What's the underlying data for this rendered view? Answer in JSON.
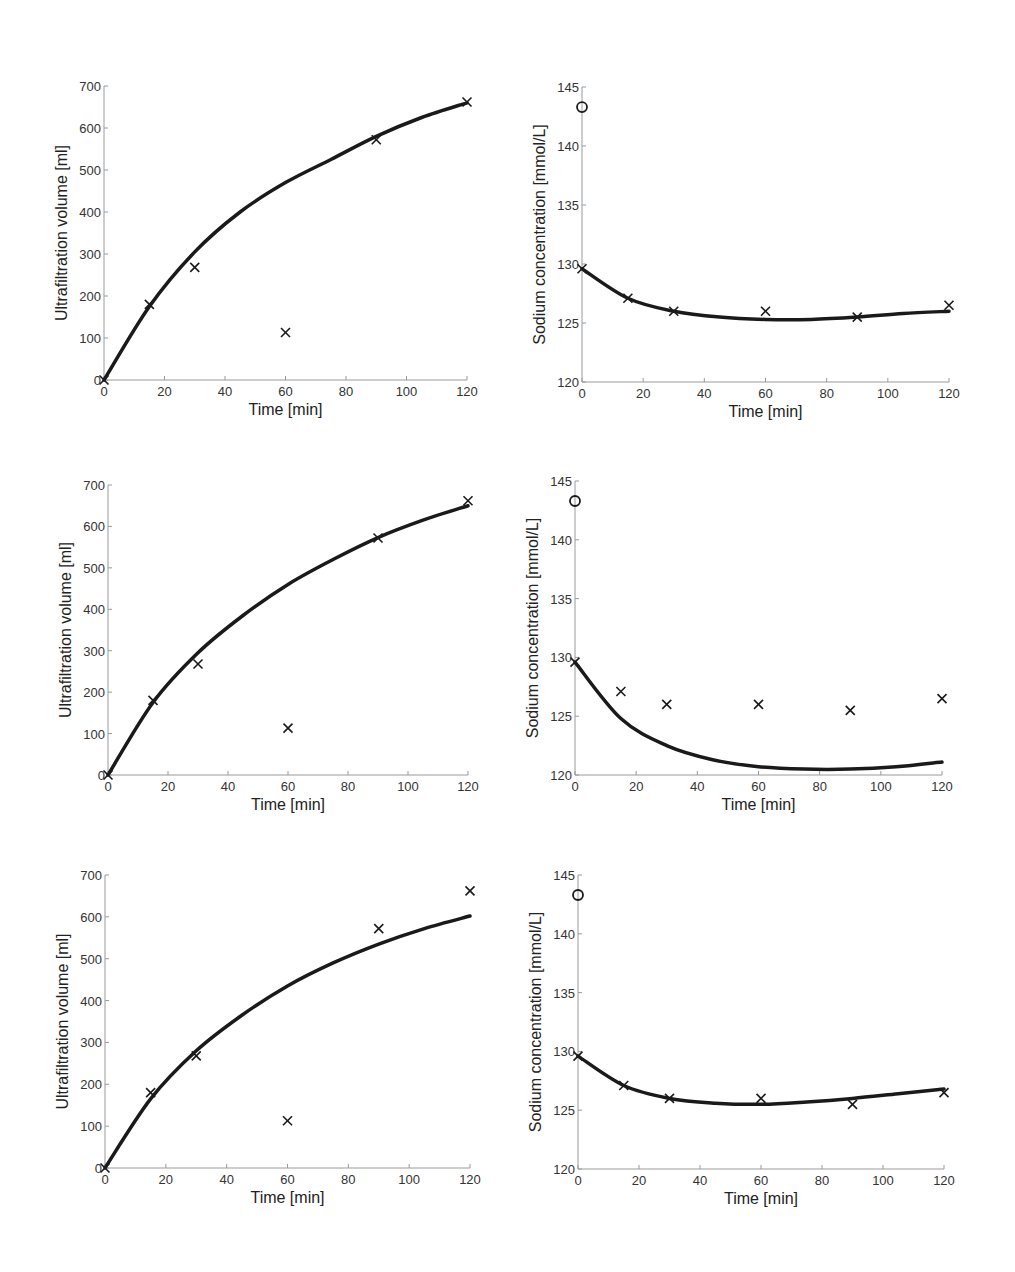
{
  "figure": {
    "background": "#ffffff",
    "line_color": "#1a1a1a",
    "axis_color": "#9a9a9a"
  },
  "chart_data": [
    {
      "id": "uf-1",
      "type": "line",
      "title": "",
      "xlabel": "Time [min]",
      "ylabel": "Ultrafiltration volume [ml]",
      "xlim": [
        0,
        120
      ],
      "ylim": [
        0,
        700
      ],
      "xticks": [
        0,
        20,
        40,
        60,
        80,
        100,
        120
      ],
      "yticks": [
        0,
        100,
        200,
        300,
        400,
        500,
        600,
        700
      ],
      "grid": false,
      "box": {
        "x0": 104,
        "x1": 467,
        "y0": 380,
        "y1": 86
      },
      "series": [
        {
          "name": "model",
          "style": "line",
          "x": [
            0,
            15,
            30,
            45,
            60,
            75,
            90,
            105,
            120
          ],
          "y": [
            0,
            175,
            305,
            400,
            470,
            525,
            580,
            625,
            660
          ]
        },
        {
          "name": "measured",
          "style": "x",
          "x": [
            0,
            15,
            30,
            60,
            90,
            120
          ],
          "y": [
            0,
            180,
            268,
            113,
            572,
            662
          ]
        }
      ]
    },
    {
      "id": "na-1",
      "type": "line",
      "title": "",
      "xlabel": "Time [min]",
      "ylabel": "Sodium concentration [mmol/L]",
      "xlim": [
        0,
        120
      ],
      "ylim": [
        120,
        145
      ],
      "xticks": [
        0,
        20,
        40,
        60,
        80,
        100,
        120
      ],
      "yticks": [
        120,
        125,
        130,
        135,
        140,
        145
      ],
      "grid": false,
      "box": {
        "x0": 582,
        "x1": 949,
        "y0": 382,
        "y1": 87
      },
      "series": [
        {
          "name": "model",
          "style": "line",
          "x": [
            0,
            15,
            30,
            45,
            60,
            75,
            90,
            105,
            120
          ],
          "y": [
            129.6,
            127.1,
            126.0,
            125.5,
            125.3,
            125.3,
            125.5,
            125.8,
            126.0
          ]
        },
        {
          "name": "measured",
          "style": "x",
          "x": [
            0,
            15,
            30,
            60,
            90,
            120
          ],
          "y": [
            129.6,
            127.1,
            126.0,
            126.0,
            125.5,
            126.5
          ]
        },
        {
          "name": "initial",
          "style": "o",
          "x": [
            0
          ],
          "y": [
            143.3
          ]
        }
      ]
    },
    {
      "id": "uf-2",
      "type": "line",
      "title": "",
      "xlabel": "Time [min]",
      "ylabel": "Ultrafiltration volume [ml]",
      "xlim": [
        0,
        120
      ],
      "ylim": [
        0,
        700
      ],
      "xticks": [
        0,
        20,
        40,
        60,
        80,
        100,
        120
      ],
      "yticks": [
        0,
        100,
        200,
        300,
        400,
        500,
        600,
        700
      ],
      "grid": false,
      "box": {
        "x0": 108,
        "x1": 468,
        "y0": 775,
        "y1": 485
      },
      "series": [
        {
          "name": "model",
          "style": "line",
          "x": [
            0,
            15,
            30,
            45,
            60,
            75,
            90,
            105,
            120
          ],
          "y": [
            0,
            175,
            295,
            385,
            460,
            520,
            573,
            615,
            650
          ]
        },
        {
          "name": "measured",
          "style": "x",
          "x": [
            0,
            15,
            30,
            60,
            90,
            120
          ],
          "y": [
            0,
            180,
            268,
            113,
            572,
            662
          ]
        }
      ]
    },
    {
      "id": "na-2",
      "type": "line",
      "title": "",
      "xlabel": "Time [min]",
      "ylabel": "Sodium concentration [mmol/L]",
      "xlim": [
        0,
        120
      ],
      "ylim": [
        120,
        145
      ],
      "xticks": [
        0,
        20,
        40,
        60,
        80,
        100,
        120
      ],
      "yticks": [
        120,
        125,
        130,
        135,
        140,
        145
      ],
      "grid": false,
      "box": {
        "x0": 575,
        "x1": 942,
        "y0": 775,
        "y1": 481
      },
      "series": [
        {
          "name": "model",
          "style": "line",
          "x": [
            0,
            15,
            30,
            45,
            60,
            75,
            90,
            105,
            120
          ],
          "y": [
            129.6,
            124.8,
            122.5,
            121.3,
            120.7,
            120.5,
            120.5,
            120.7,
            121.1
          ]
        },
        {
          "name": "measured",
          "style": "x",
          "x": [
            0,
            15,
            30,
            60,
            90,
            120
          ],
          "y": [
            129.6,
            127.1,
            126.0,
            126.0,
            125.5,
            126.5
          ]
        },
        {
          "name": "initial",
          "style": "o",
          "x": [
            0
          ],
          "y": [
            143.3
          ]
        }
      ]
    },
    {
      "id": "uf-3",
      "type": "line",
      "title": "",
      "xlabel": "Time [min]",
      "ylabel": "Ultrafiltration volume [ml]",
      "xlim": [
        0,
        120
      ],
      "ylim": [
        0,
        700
      ],
      "xticks": [
        0,
        20,
        40,
        60,
        80,
        100,
        120
      ],
      "yticks": [
        0,
        100,
        200,
        300,
        400,
        500,
        600,
        700
      ],
      "grid": false,
      "box": {
        "x0": 105,
        "x1": 470,
        "y0": 1168,
        "y1": 875
      },
      "series": [
        {
          "name": "model",
          "style": "line",
          "x": [
            0,
            15,
            30,
            45,
            60,
            75,
            90,
            105,
            120
          ],
          "y": [
            0,
            165,
            280,
            365,
            435,
            490,
            535,
            572,
            602
          ]
        },
        {
          "name": "measured",
          "style": "x",
          "x": [
            0,
            15,
            30,
            60,
            90,
            120
          ],
          "y": [
            0,
            180,
            268,
            113,
            572,
            662
          ]
        }
      ]
    },
    {
      "id": "na-3",
      "type": "line",
      "title": "",
      "xlabel": "Time [min]",
      "ylabel": "Sodium concentration [mmol/L]",
      "xlim": [
        0,
        120
      ],
      "ylim": [
        120,
        145
      ],
      "xticks": [
        0,
        20,
        40,
        60,
        80,
        100,
        120
      ],
      "yticks": [
        120,
        125,
        130,
        135,
        140,
        145
      ],
      "grid": false,
      "box": {
        "x0": 578,
        "x1": 944,
        "y0": 1169,
        "y1": 875
      },
      "series": [
        {
          "name": "model",
          "style": "line",
          "x": [
            0,
            15,
            30,
            45,
            60,
            75,
            90,
            105,
            120
          ],
          "y": [
            129.6,
            127.1,
            126.0,
            125.6,
            125.5,
            125.7,
            126.0,
            126.4,
            126.8
          ]
        },
        {
          "name": "measured",
          "style": "x",
          "x": [
            0,
            15,
            30,
            60,
            90,
            120
          ],
          "y": [
            129.6,
            127.1,
            126.0,
            126.0,
            125.5,
            126.5
          ]
        },
        {
          "name": "initial",
          "style": "o",
          "x": [
            0
          ],
          "y": [
            143.3
          ]
        }
      ]
    }
  ]
}
